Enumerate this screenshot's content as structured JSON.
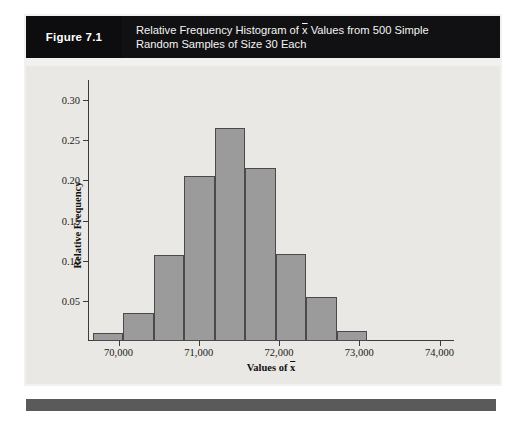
{
  "figure": {
    "number_label": "Figure 7.1",
    "caption_line1_pre": "Relative Frequency Histogram of ",
    "caption_xbar": "x",
    "caption_line1_post": " Values from 500 Simple",
    "caption_line2": "Random Samples of Size 30 Each",
    "header_bg": "#111114",
    "number_bg": "#0d0d0f",
    "card_bg": "#f2f1ef",
    "chart_bg": "#e9e8e4",
    "footer_bg": "#5a5a5a"
  },
  "chart_data": {
    "type": "bar",
    "xlabel": "Values of x̄",
    "ylabel": "Relative Frequency",
    "xlim": [
      69620,
      74180
    ],
    "ylim": [
      0,
      0.325
    ],
    "grid": false,
    "legend": "none",
    "bar_fill": "#9b9b9b",
    "bar_stroke": "#4a4a4a",
    "axis_color": "#3c3c3c",
    "bin_width": 380,
    "sample_count": 500,
    "sample_size": 30,
    "x_ticks": [
      {
        "value": 70000,
        "label": "70,000"
      },
      {
        "value": 71000,
        "label": "71,000"
      },
      {
        "value": 72000,
        "label": "72,000"
      },
      {
        "value": 73000,
        "label": "73,000"
      },
      {
        "value": 74000,
        "label": "74,000"
      }
    ],
    "y_ticks": [
      {
        "value": 0.05,
        "label": "0.05"
      },
      {
        "value": 0.1,
        "label": "0.10"
      },
      {
        "value": 0.15,
        "label": "0.15"
      },
      {
        "value": 0.2,
        "label": "0.20"
      },
      {
        "value": 0.25,
        "label": "0.25"
      },
      {
        "value": 0.3,
        "label": "0.30"
      }
    ],
    "bins": [
      {
        "x0": 69680,
        "x1": 70060,
        "value": 0.01
      },
      {
        "x0": 70060,
        "x1": 70440,
        "value": 0.035
      },
      {
        "x0": 70440,
        "x1": 70820,
        "value": 0.107
      },
      {
        "x0": 70820,
        "x1": 71200,
        "value": 0.205
      },
      {
        "x0": 71200,
        "x1": 71580,
        "value": 0.265
      },
      {
        "x0": 71580,
        "x1": 71960,
        "value": 0.215
      },
      {
        "x0": 71960,
        "x1": 72340,
        "value": 0.108
      },
      {
        "x0": 72340,
        "x1": 72720,
        "value": 0.055
      },
      {
        "x0": 72720,
        "x1": 73100,
        "value": 0.012
      }
    ],
    "categories": [
      "69,680-70,060",
      "70,060-70,440",
      "70,440-70,820",
      "70,820-71,200",
      "71,200-71,580",
      "71,580-71,960",
      "71,960-72,340",
      "72,340-72,720",
      "72,720-73,100"
    ],
    "values": [
      0.01,
      0.035,
      0.107,
      0.205,
      0.265,
      0.215,
      0.108,
      0.055,
      0.012
    ]
  }
}
